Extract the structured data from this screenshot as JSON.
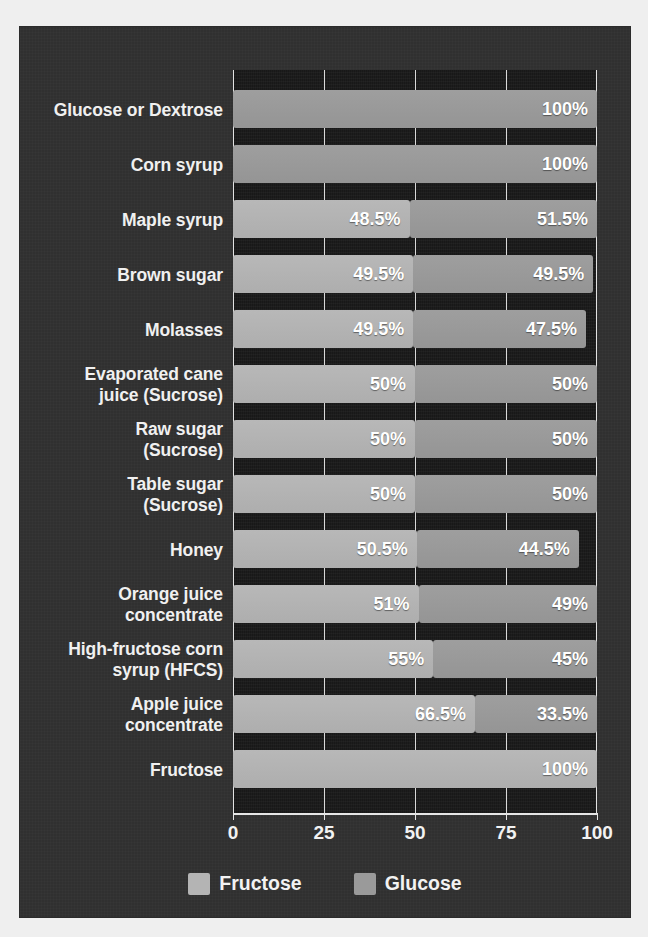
{
  "chart_data": {
    "type": "bar",
    "subtype": "stacked-horizontal",
    "title": "",
    "subtitle": "",
    "xlabel": "",
    "ylabel": "",
    "xlim": [
      0,
      100
    ],
    "xticks": [
      0,
      25,
      50,
      75,
      100
    ],
    "xtick_labels": [
      "0",
      "25",
      "50",
      "75",
      "100"
    ],
    "grid": true,
    "grid_axis": "x",
    "legend_position": "bottom-center",
    "legend": [
      {
        "name": "Fructose",
        "color": "#b4b4b4"
      },
      {
        "name": "Glucose",
        "color": "#9a9a9a"
      }
    ],
    "categories": [
      "Glucose or Dextrose",
      "Corn syrup",
      "Maple syrup",
      "Brown sugar",
      "Molasses",
      "Evaporated cane juice (Sucrose)",
      "Raw sugar (Sucrose)",
      "Table sugar (Sucrose)",
      "Honey",
      "Orange juice concentrate",
      "High-fructose corn syrup (HFCS)",
      "Apple juice concentrate",
      "Fructose"
    ],
    "series": [
      {
        "name": "Fructose",
        "color": "#b4b4b4",
        "values": [
          0,
          0,
          48.5,
          49.5,
          49.5,
          50,
          50,
          50,
          50.5,
          51,
          55,
          66.5,
          100
        ]
      },
      {
        "name": "Glucose",
        "color": "#9a9a9a",
        "values": [
          100,
          100,
          51.5,
          49.5,
          47.5,
          50,
          50,
          50,
          44.5,
          49,
          45,
          33.5,
          0
        ]
      }
    ]
  },
  "rows": [
    {
      "label": "Glucose or Dextrose",
      "fructose": {
        "value": 0,
        "label": ""
      },
      "glucose": {
        "value": 100,
        "label": "100%"
      }
    },
    {
      "label": "Corn syrup",
      "fructose": {
        "value": 0,
        "label": ""
      },
      "glucose": {
        "value": 100,
        "label": "100%"
      }
    },
    {
      "label": "Maple syrup",
      "fructose": {
        "value": 48.5,
        "label": "48.5%"
      },
      "glucose": {
        "value": 51.5,
        "label": "51.5%"
      }
    },
    {
      "label": "Brown sugar",
      "fructose": {
        "value": 49.5,
        "label": "49.5%"
      },
      "glucose": {
        "value": 49.5,
        "label": "49.5%"
      }
    },
    {
      "label": "Molasses",
      "fructose": {
        "value": 49.5,
        "label": "49.5%"
      },
      "glucose": {
        "value": 47.5,
        "label": "47.5%"
      }
    },
    {
      "label": "Evaporated cane\njuice (Sucrose)",
      "fructose": {
        "value": 50,
        "label": "50%"
      },
      "glucose": {
        "value": 50,
        "label": "50%"
      }
    },
    {
      "label": "Raw sugar\n(Sucrose)",
      "fructose": {
        "value": 50,
        "label": "50%"
      },
      "glucose": {
        "value": 50,
        "label": "50%"
      }
    },
    {
      "label": "Table sugar\n(Sucrose)",
      "fructose": {
        "value": 50,
        "label": "50%"
      },
      "glucose": {
        "value": 50,
        "label": "50%"
      }
    },
    {
      "label": "Honey",
      "fructose": {
        "value": 50.5,
        "label": "50.5%"
      },
      "glucose": {
        "value": 44.5,
        "label": "44.5%"
      }
    },
    {
      "label": "Orange juice\nconcentrate",
      "fructose": {
        "value": 51,
        "label": "51%"
      },
      "glucose": {
        "value": 49,
        "label": "49%"
      }
    },
    {
      "label": "High-fructose corn\nsyrup (HFCS)",
      "fructose": {
        "value": 55,
        "label": "55%"
      },
      "glucose": {
        "value": 45,
        "label": "45%"
      }
    },
    {
      "label": "Apple juice\nconcentrate",
      "fructose": {
        "value": 66.5,
        "label": "66.5%"
      },
      "glucose": {
        "value": 33.5,
        "label": "33.5%"
      }
    },
    {
      "label": "Fructose",
      "fructose": {
        "value": 100,
        "label": "100%"
      },
      "glucose": {
        "value": 0,
        "label": ""
      }
    }
  ],
  "axis": {
    "ticks": [
      "0",
      "25",
      "50",
      "75",
      "100"
    ],
    "tick_values": [
      0,
      25,
      50,
      75,
      100
    ]
  },
  "legend": {
    "fructose_label": "Fructose",
    "glucose_label": "Glucose"
  },
  "colors": {
    "panel_background": "#323232",
    "plot_background": "#1b1b1b",
    "fructose": "#b4b4b4",
    "glucose": "#9a9a9a",
    "text": "#f2f2f2",
    "gridline": "#d8d8d8"
  }
}
